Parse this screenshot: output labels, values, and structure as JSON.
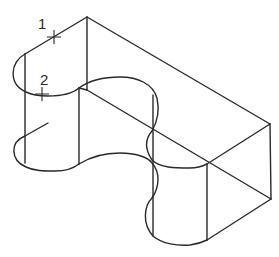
{
  "diagram": {
    "type": "isometric-wireframe",
    "stroke_color": "#2a2a2a",
    "background": "#ffffff",
    "points": [
      {
        "label": "1",
        "x": 54,
        "y": 37
      },
      {
        "label": "2",
        "x": 42,
        "y": 94
      }
    ]
  }
}
